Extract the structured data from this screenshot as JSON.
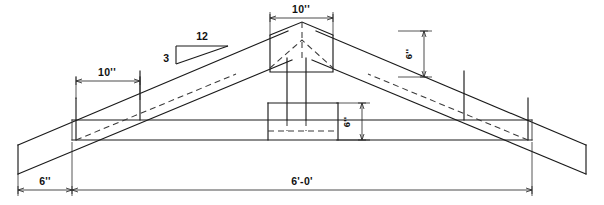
{
  "drawing": {
    "title": "Roof Truss Elevation",
    "type": "engineering-drawing",
    "units": "feet-inches",
    "line_color": "#1a1a1a",
    "background_color": "#ffffff"
  },
  "dimensions": {
    "peak_plate_width": "10''",
    "peak_plate_height": "6''",
    "left_splice_plate_width": "10''",
    "center_block_height": "6''",
    "left_overhang": "6''",
    "overall_span": "6'-0'"
  },
  "slope_indicator": {
    "run_label": "12",
    "rise_label": "3",
    "description": "3-in-12 roof pitch triangle"
  },
  "geometry": {
    "peak_x": 302,
    "peak_y": 30,
    "bottom_chord_top_y": 120,
    "bottom_chord_bottom_y": 140,
    "left_bearing_x": 72,
    "right_bearing_x": 532,
    "center_block_left_x": 268,
    "center_block_right_x": 338,
    "center_post_left_x": 287,
    "center_post_right_x": 305,
    "peak_plate_left_x": 270,
    "peak_plate_right_x": 333,
    "left_splice_left_x": 76,
    "left_splice_right_x": 140
  },
  "labels": {
    "top_peak_width": "10''",
    "left_plate_width": "10''",
    "right_rafter_depth": "6''",
    "center_block_depth": "6''",
    "left_tail_length": "6''",
    "span_total": "6'-0'",
    "pitch_run": "12",
    "pitch_rise": "3"
  }
}
